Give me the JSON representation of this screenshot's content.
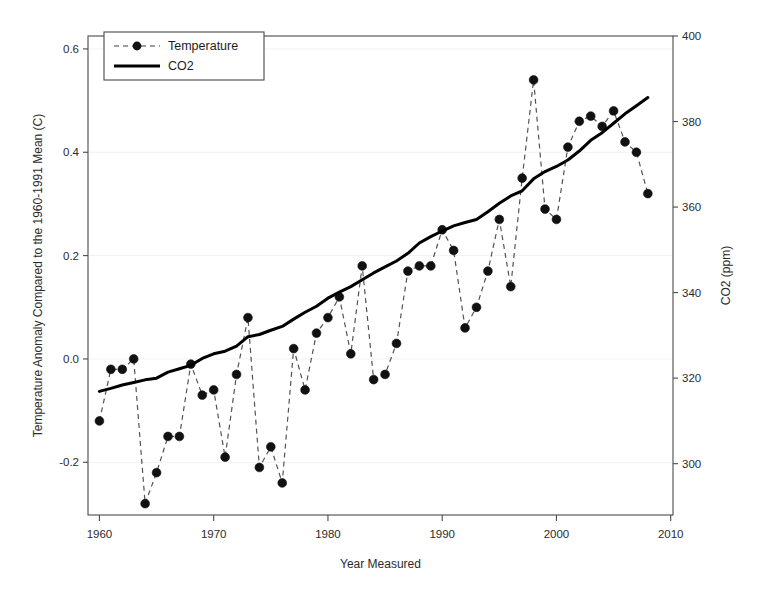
{
  "chart_data": {
    "type": "line",
    "title": "",
    "xlabel": "Year Measured",
    "ylabel": "Temperature Anomaly Compared to the 1960-1991 Mean (C)",
    "y2label": "CO2 (ppm)",
    "xlim": [
      1959,
      2010.2
    ],
    "ylim": [
      -0.302,
      0.625
    ],
    "y2lim": [
      288.0,
      400.0
    ],
    "xticks": [
      1960,
      1970,
      1980,
      1990,
      2000,
      2010
    ],
    "xticklabels": [
      "1960",
      "1970",
      "1980",
      "1990",
      "2000",
      "2010"
    ],
    "yticks": [
      -0.2,
      0.0,
      0.2,
      0.4,
      0.6
    ],
    "yticklabels": [
      "-0.2",
      "0.0",
      "0.2",
      "0.4",
      "0.6"
    ],
    "y2ticks": [
      300,
      320,
      340,
      360,
      380,
      400
    ],
    "y2ticklabels": [
      "300",
      "320",
      "340",
      "360",
      "380",
      "400"
    ],
    "grid": false,
    "legend_position": "top-left",
    "series": [
      {
        "name": "Temperature",
        "axis": "left",
        "style": "dashed-with-markers",
        "color": "#111111",
        "x": [
          1960,
          1961,
          1962,
          1963,
          1964,
          1965,
          1966,
          1967,
          1968,
          1969,
          1970,
          1971,
          1972,
          1973,
          1974,
          1975,
          1976,
          1977,
          1978,
          1979,
          1980,
          1981,
          1982,
          1983,
          1984,
          1985,
          1986,
          1987,
          1988,
          1989,
          1990,
          1991,
          1992,
          1993,
          1994,
          1995,
          1996,
          1997,
          1998,
          1999,
          2000,
          2001,
          2002,
          2003,
          2004,
          2005,
          2006,
          2007,
          2008
        ],
        "values": [
          -0.12,
          -0.02,
          -0.02,
          0.0,
          -0.28,
          -0.22,
          -0.15,
          -0.15,
          -0.01,
          -0.07,
          -0.06,
          -0.19,
          -0.03,
          0.08,
          -0.21,
          -0.17,
          -0.24,
          0.02,
          -0.06,
          0.05,
          0.08,
          0.12,
          0.01,
          0.18,
          -0.04,
          -0.03,
          0.03,
          0.17,
          0.18,
          0.18,
          0.25,
          0.21,
          0.06,
          0.1,
          0.17,
          0.27,
          0.14,
          0.35,
          0.54,
          0.29,
          0.27,
          0.41,
          0.46,
          0.47,
          0.45,
          0.48,
          0.42,
          0.4,
          0.32
        ]
      },
      {
        "name": "CO2",
        "axis": "right",
        "style": "solid",
        "color": "#000000",
        "x": [
          1960,
          1961,
          1962,
          1963,
          1964,
          1965,
          1966,
          1967,
          1968,
          1969,
          1970,
          1971,
          1972,
          1973,
          1974,
          1975,
          1976,
          1977,
          1978,
          1979,
          1980,
          1981,
          1982,
          1983,
          1984,
          1985,
          1986,
          1987,
          1988,
          1989,
          1990,
          1991,
          1992,
          1993,
          1994,
          1995,
          1996,
          1997,
          1998,
          1999,
          2000,
          2001,
          2002,
          2003,
          2004,
          2005,
          2006,
          2007,
          2008
        ],
        "values": [
          316.9,
          317.6,
          318.4,
          319.0,
          319.6,
          320.0,
          321.4,
          322.2,
          323.0,
          324.6,
          325.7,
          326.3,
          327.5,
          329.7,
          330.2,
          331.2,
          332.1,
          333.8,
          335.4,
          336.8,
          338.7,
          340.1,
          341.4,
          343.0,
          344.6,
          346.0,
          347.4,
          349.2,
          351.6,
          353.1,
          354.4,
          355.6,
          356.4,
          357.1,
          358.9,
          360.9,
          362.6,
          363.8,
          366.6,
          368.3,
          369.5,
          371.0,
          373.1,
          375.6,
          377.4,
          379.6,
          381.8,
          383.7,
          385.6
        ]
      }
    ]
  },
  "legend": {
    "entries": [
      {
        "label": "Temperature",
        "marker": "circle",
        "line": "dashed"
      },
      {
        "label": "CO2",
        "marker": "none",
        "line": "solid"
      }
    ]
  }
}
